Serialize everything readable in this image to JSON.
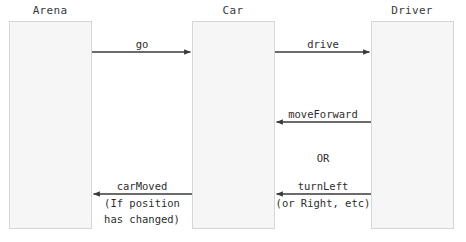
{
  "diagram": {
    "type": "sequence-diagram",
    "width": 466,
    "height": 242,
    "background_color": "#ffffff",
    "lifeline_fill": "#f6f6f6",
    "lifeline_border": "#d6d6d6",
    "arrow_color": "#3a3a3a",
    "text_color": "#2e2e2e"
  },
  "participants": [
    {
      "id": "arena",
      "label": "Arena",
      "x": 9,
      "y": 21,
      "width": 83,
      "height": 208,
      "title_center_x": 50,
      "title_y": 4
    },
    {
      "id": "car",
      "label": "Car",
      "x": 192,
      "y": 21,
      "width": 83,
      "height": 208,
      "title_center_x": 233,
      "title_y": 4
    },
    {
      "id": "driver",
      "label": "Driver",
      "x": 371,
      "y": 21,
      "width": 83,
      "height": 208,
      "title_center_x": 412,
      "title_y": 4
    }
  ],
  "messages": [
    {
      "id": "go",
      "label": "go",
      "from": "arena",
      "to": "car",
      "direction": "right",
      "x1": 92,
      "x2": 192,
      "y": 52,
      "label_center_x": 142,
      "label_y": 38,
      "sublabel": null
    },
    {
      "id": "drive",
      "label": "drive",
      "from": "car",
      "to": "driver",
      "direction": "right",
      "x1": 275,
      "x2": 371,
      "y": 52,
      "label_center_x": 323,
      "label_y": 38,
      "sublabel": null
    },
    {
      "id": "moveForward",
      "label": "moveForward",
      "from": "driver",
      "to": "car",
      "direction": "left",
      "x1": 275,
      "x2": 371,
      "y": 122,
      "label_center_x": 323,
      "label_y": 108,
      "sublabel": null
    },
    {
      "id": "turnLeft",
      "label": "turnLeft",
      "from": "driver",
      "to": "car",
      "direction": "left",
      "x1": 275,
      "x2": 371,
      "y": 194,
      "label_center_x": 323,
      "label_y": 180,
      "sublabel": "(or Right, etc)",
      "sublabel_y": 196
    },
    {
      "id": "carMoved",
      "label": "carMoved",
      "from": "car",
      "to": "arena",
      "direction": "left",
      "x1": 92,
      "x2": 192,
      "y": 194,
      "label_center_x": 142,
      "label_y": 180,
      "sublabel": "(If position",
      "sublabel_y": 196,
      "sublabel2": "has changed)",
      "sublabel2_y": 212
    }
  ],
  "annotations": [
    {
      "id": "or-separator",
      "label": "OR",
      "center_x": 323,
      "y": 152
    }
  ]
}
